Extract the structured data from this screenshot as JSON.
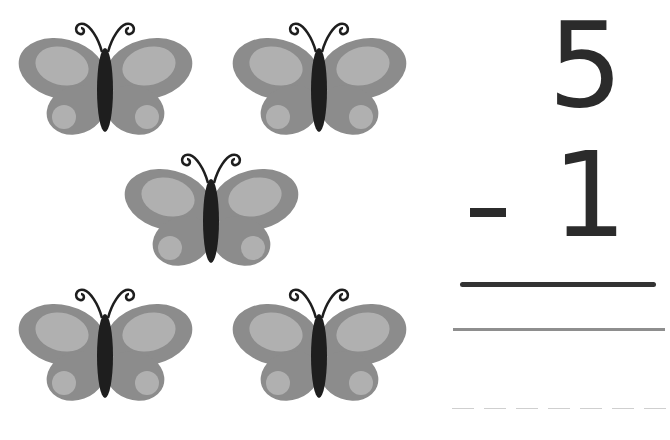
{
  "problem": {
    "minuend": "5",
    "operator": "-",
    "subtrahend": "1",
    "answer": ""
  },
  "illustration": {
    "object": "butterfly",
    "count": 5,
    "layout": "2-1-2",
    "icon": "butterfly-icon"
  },
  "colors": {
    "wing_outer": "#8c8c8c",
    "wing_inner": "#b0b0b0",
    "body": "#1e1e1e",
    "digits": "#2b2b2b",
    "answer_line": "#333333",
    "guide_line": "#8e8e8e",
    "dash_line": "#cfcfcf"
  }
}
